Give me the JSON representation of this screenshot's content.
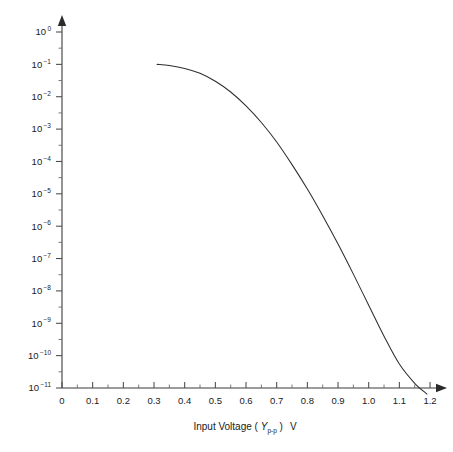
{
  "chart_data": {
    "type": "line",
    "title": "",
    "xlabel": "Input Voltage ( Y_p-p )  V",
    "xlabel_parts": {
      "prefix": "Input Voltage ( ",
      "symbol": "Y",
      "subscript": "p-p",
      "suffix": " )",
      "unit": "V"
    },
    "ylabel": "",
    "yscale": "log",
    "xscale": "linear",
    "xlim": [
      0,
      1.2
    ],
    "ylim": [
      1e-11,
      1
    ],
    "grid": false,
    "legend": null,
    "x_ticks": [
      0,
      0.1,
      0.2,
      0.3,
      0.4,
      0.5,
      0.6,
      0.7,
      0.8,
      0.9,
      1.0,
      1.1,
      1.2
    ],
    "x_tick_labels": [
      "0",
      "0.1",
      "0.2",
      "0.3",
      "0.4",
      "0.5",
      "0.6",
      "0.7",
      "0.8",
      "0.9",
      "1.0",
      "1.1",
      "1.2"
    ],
    "x_minor_tick_step": 0.05,
    "y_ticks": [
      1,
      0.1,
      0.01,
      0.001,
      0.0001,
      1e-05,
      1e-06,
      1e-07,
      1e-08,
      1e-09,
      1e-10,
      1e-11
    ],
    "y_tick_labels": [
      {
        "mantissa": "10",
        "exponent": "0"
      },
      {
        "mantissa": "10",
        "exponent": "−1"
      },
      {
        "mantissa": "10",
        "exponent": "−2"
      },
      {
        "mantissa": "10",
        "exponent": "−3"
      },
      {
        "mantissa": "10",
        "exponent": "−4"
      },
      {
        "mantissa": "10",
        "exponent": "−5"
      },
      {
        "mantissa": "10",
        "exponent": "−6"
      },
      {
        "mantissa": "10",
        "exponent": "−7"
      },
      {
        "mantissa": "10",
        "exponent": "−8"
      },
      {
        "mantissa": "10",
        "exponent": "−9"
      },
      {
        "mantissa": "10",
        "exponent": "−10"
      },
      {
        "mantissa": "10",
        "exponent": "−11"
      }
    ],
    "y_minor_ticks_per_decade": 1,
    "series": [
      {
        "name": "bit error rate curve",
        "color": "#2e2e2e",
        "x": [
          0.31,
          0.35,
          0.4,
          0.45,
          0.5,
          0.55,
          0.6,
          0.65,
          0.7,
          0.75,
          0.8,
          0.85,
          0.9,
          0.95,
          1.0,
          1.05,
          1.1,
          1.15,
          1.19
        ],
        "y": [
          0.1,
          0.092,
          0.075,
          0.053,
          0.03,
          0.014,
          0.0052,
          0.0016,
          0.0004,
          8e-05,
          1.4e-05,
          2.1e-06,
          2.8e-07,
          3.3e-08,
          3.6e-09,
          4e-10,
          5.5e-11,
          1.4e-11,
          6.5e-12
        ]
      }
    ]
  },
  "colors": {
    "background": "#ffffff",
    "axis": "#3b3b3b",
    "tick": "#4a4a4a",
    "curve": "#2e2e2e",
    "text": "#1a1a1a"
  }
}
